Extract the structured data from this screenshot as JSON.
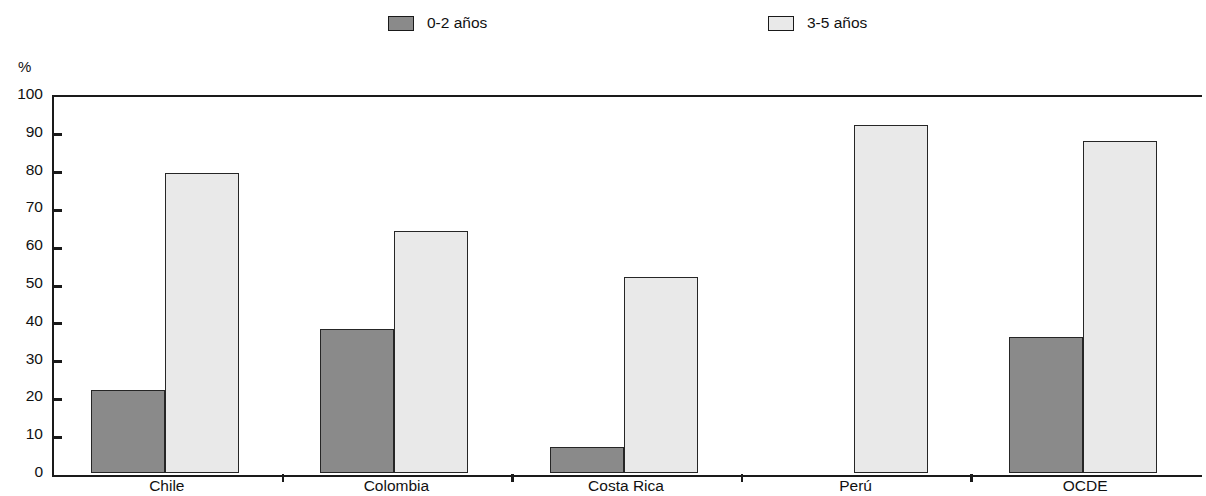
{
  "chart_data": {
    "type": "bar",
    "title": "",
    "subtitle": "",
    "xlabel": "",
    "ylabel": "%",
    "ylim": [
      0,
      100
    ],
    "yticks": [
      0,
      10,
      20,
      30,
      40,
      50,
      60,
      70,
      80,
      90,
      100
    ],
    "ytick_labels": [
      "0",
      "10",
      "20",
      "30",
      "40",
      "50",
      "60",
      "70",
      "80",
      "90",
      "100"
    ],
    "grid": false,
    "legend_position": "top",
    "categories": [
      "Chile",
      "Colombia",
      "Costa Rica",
      "Perú",
      "OCDE"
    ],
    "series": [
      {
        "name": "0-2 años",
        "color": "#8a8a8a",
        "values": [
          22,
          38,
          7,
          0,
          36
        ]
      },
      {
        "name": "3-5 años",
        "color": "#e9e9e9",
        "values": [
          79.5,
          64,
          51.8,
          92,
          87.8
        ]
      }
    ]
  },
  "legend": {
    "items": [
      {
        "label": "0-2 años"
      },
      {
        "label": "3-5 años"
      }
    ]
  },
  "axis": {
    "unit_label": "%"
  }
}
